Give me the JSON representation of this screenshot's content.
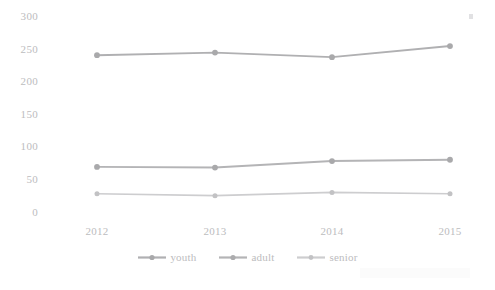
{
  "chart_data": {
    "type": "line",
    "title": "",
    "subtitle": "",
    "xlabel": "",
    "ylabel": "",
    "categories": [
      "2012",
      "2013",
      "2014",
      "2015"
    ],
    "series": [
      {
        "name": "youth",
        "values": [
          240,
          244,
          237,
          254
        ],
        "color": "#b0b0b2"
      },
      {
        "name": "adult",
        "values": [
          69,
          68,
          78,
          80
        ],
        "color": "#b4b4b6"
      },
      {
        "name": "senior",
        "values": [
          28,
          25,
          30,
          28
        ],
        "color": "#cdcdcf"
      }
    ],
    "ylim": [
      0,
      300
    ],
    "y_ticks": [
      "0",
      "50",
      "100",
      "150",
      "200",
      "250",
      "300"
    ],
    "grid": false,
    "legend_position": "bottom",
    "markers": true
  },
  "axes": {
    "y_tick_labels": [
      "300",
      "250",
      "200",
      "150",
      "100",
      "50",
      "0"
    ],
    "x_tick_labels": [
      "2012",
      "2013",
      "2014",
      "2015"
    ]
  },
  "legend": {
    "items": [
      {
        "label": "youth"
      },
      {
        "label": "adult"
      },
      {
        "label": "senior"
      }
    ]
  }
}
